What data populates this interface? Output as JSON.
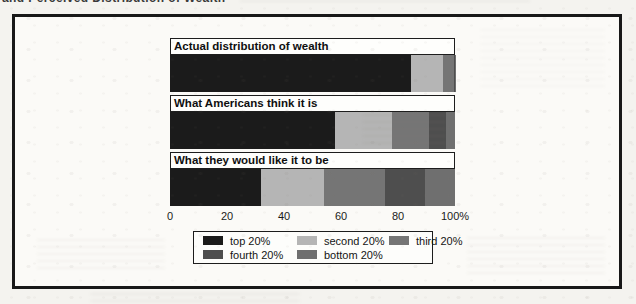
{
  "page": {
    "cropped_top_text": "and Perceived Distribution of Wealth"
  },
  "chart_data": {
    "type": "bar",
    "variant": "horizontal-stacked",
    "unit": "%",
    "xlim": [
      0,
      100
    ],
    "grid": false,
    "legend_position": "bottom",
    "x_ticks": [
      {
        "label": "0",
        "value": 0
      },
      {
        "label": "20",
        "value": 20
      },
      {
        "label": "40",
        "value": 40
      },
      {
        "label": "60",
        "value": 60
      },
      {
        "label": "80",
        "value": 80
      },
      {
        "label": "100%",
        "value": 100
      }
    ],
    "quintiles": [
      "top 20%",
      "second 20%",
      "third 20%",
      "fourth 20%",
      "bottom 20%"
    ],
    "colors": [
      "#1b1b1b",
      "#b5b5b5",
      "#757575",
      "#4e4e4e",
      "#6f6f6f"
    ],
    "rows": [
      {
        "label": "Actual distribution of wealth",
        "values": [
          84.4,
          11.3,
          3.9,
          0.3,
          0.1
        ]
      },
      {
        "label": "What Americans think it is",
        "values": [
          58,
          20,
          13,
          6,
          3
        ]
      },
      {
        "label": "What they would like it to be",
        "values": [
          32,
          22,
          21.5,
          14,
          10.5
        ]
      }
    ]
  }
}
